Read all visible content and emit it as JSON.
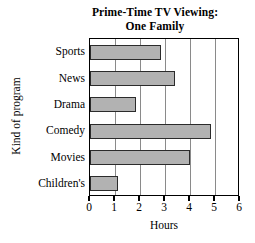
{
  "chart_data": {
    "type": "bar",
    "orientation": "horizontal",
    "title": "Prime-Time TV Viewing:\nOne Family",
    "title_line1": "Prime-Time TV Viewing:",
    "title_line2": "One Family",
    "xlabel": "Hours",
    "ylabel": "Kind of program",
    "categories": [
      "Sports",
      "News",
      "Drama",
      "Comedy",
      "Movies",
      "Children's"
    ],
    "values": [
      2.85,
      3.4,
      1.85,
      4.85,
      4.0,
      1.1
    ],
    "xlim": [
      0,
      6
    ],
    "xticks": [
      0,
      1,
      2,
      3,
      4,
      5,
      6
    ],
    "xtick_labels": [
      "0",
      "1",
      "2",
      "3",
      "4",
      "5",
      "6"
    ],
    "grid": "vertical",
    "legend": "none",
    "bar_color": "#b2b2b2",
    "bar_edge_color": "#2b2b2b",
    "frame_color": "#000000",
    "gridline_color": "#8a8a8a",
    "background": "#ffffff"
  }
}
